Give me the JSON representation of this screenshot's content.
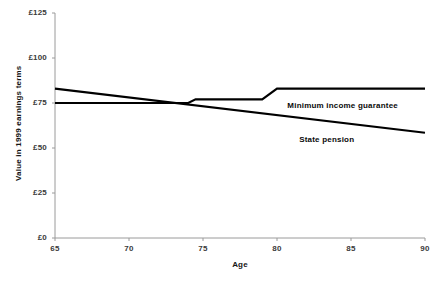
{
  "chart_data": {
    "type": "line",
    "title": "",
    "xlabel": "Age",
    "ylabel": "Value in 1999 earnings terms",
    "xlim": [
      65,
      90
    ],
    "ylim": [
      0,
      125
    ],
    "xticks": [
      65,
      70,
      75,
      80,
      85,
      90
    ],
    "xtick_labels": [
      "65",
      "70",
      "75",
      "80",
      "85",
      "90"
    ],
    "yticks": [
      0,
      25,
      50,
      75,
      100,
      125
    ],
    "ytick_labels": [
      "£0",
      "£25",
      "£50",
      "£75",
      "£100",
      "£125"
    ],
    "grid": false,
    "legend_position": "inline-labels",
    "line_color": "#000000",
    "series": [
      {
        "name": "State pension",
        "label": "State pension",
        "x": [
          65,
          90
        ],
        "values": [
          83,
          58.5
        ],
        "label_x": 81.5,
        "label_y": 58.5
      },
      {
        "name": "Minimum income guarantee",
        "label": "Minimum income guarantee",
        "x": [
          65,
          74,
          74.5,
          79,
          80,
          90
        ],
        "values": [
          75,
          75,
          77,
          77,
          83,
          83
        ],
        "label_x": 80.7,
        "label_y": 77.5
      }
    ]
  },
  "axis": {
    "x_title": "Age",
    "y_title": "Value in 1999 earnings terms"
  }
}
